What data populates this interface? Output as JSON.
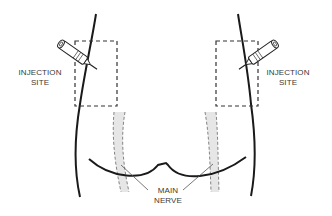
{
  "diagram": {
    "labels": {
      "left_site": {
        "line1": "INJECTION",
        "line2": "SITE"
      },
      "right_site": {
        "line1": "INJECTION",
        "line2": "SITE"
      },
      "nerve": {
        "line1": "MAIN",
        "line2": "NERVE"
      }
    },
    "colors": {
      "outline": "#1a1a1a",
      "dashed_box": "#333333",
      "nerve_fill": "#e6e6e6",
      "nerve_dash": "#777777",
      "leader": "#555555",
      "text": "#3a3a3a"
    },
    "icons": [
      "syringe-icon-left",
      "syringe-icon-right"
    ]
  }
}
